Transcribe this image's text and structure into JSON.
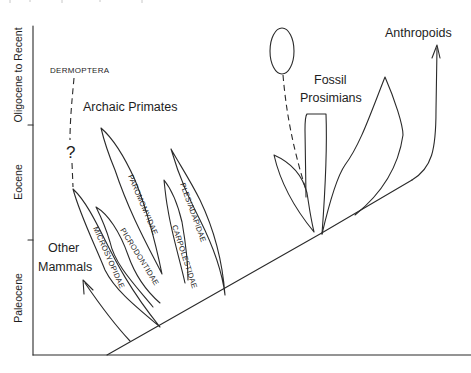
{
  "diagram": {
    "type": "phylogenetic-tree",
    "axis": {
      "periods": [
        {
          "label": "Oligocene to Recent"
        },
        {
          "label": "Eocene"
        },
        {
          "label": "Paleocene"
        }
      ]
    },
    "group_labels": {
      "dermoptera": "DERMOPTERA",
      "question_mark": "?",
      "archaic_primates": "Archaic Primates",
      "other_mammals_line1": "Other",
      "other_mammals_line2": "Mammals",
      "fossil_prosimians_line1": "Fossil",
      "fossil_prosimians_line2": "Prosimians",
      "anthropoids": "Anthropoids"
    },
    "families": [
      {
        "label": "MICROSYOPIDAE"
      },
      {
        "label": "PICRODONTIDAE"
      },
      {
        "label": "PAROMOMYIDAE"
      },
      {
        "label": "CARPOLESTIDAE"
      },
      {
        "label": "PLESIADAPIDAE"
      }
    ],
    "colors": {
      "line": "#2a2a2a",
      "background": "#ffffff"
    }
  }
}
